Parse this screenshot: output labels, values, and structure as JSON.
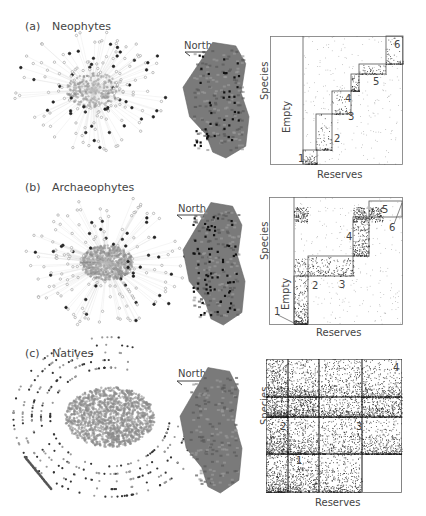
{
  "panels": [
    {
      "letter": "(a)",
      "title": "Neophytes",
      "north_label": "North",
      "matrix": {
        "ylabel": "Species",
        "xlabel": "Reserves",
        "empty_label": "Empty",
        "module_numbers": [
          "1",
          "2",
          "3",
          "4",
          "5",
          "6"
        ]
      }
    },
    {
      "letter": "(b)",
      "title": "Archaeophytes",
      "north_label": "North",
      "matrix": {
        "ylabel": "Species",
        "xlabel": "Reserves",
        "empty_label": "Empty",
        "module_numbers": [
          "1",
          "2",
          "3",
          "4",
          "5",
          "6"
        ]
      }
    },
    {
      "letter": "(c)",
      "title": "Natives",
      "north_label": "North",
      "matrix": {
        "ylabel": "Species",
        "xlabel": "Reserves",
        "module_numbers": [
          "1",
          "2",
          "3",
          "4"
        ]
      }
    }
  ],
  "colors": {
    "text": "#444444",
    "frame": "#555555",
    "dots": "#222222",
    "network": "#8a8a8a",
    "map": "#7a7a7a"
  }
}
